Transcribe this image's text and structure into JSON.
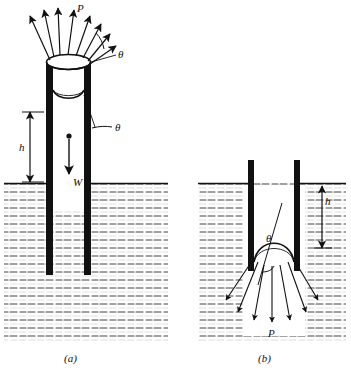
{
  "figure": {
    "panels": [
      {
        "id": "a",
        "caption": "(a)",
        "labels": [
          {
            "name": "force-P",
            "text": "P"
          },
          {
            "name": "angle-theta-outer",
            "text": "θ"
          },
          {
            "name": "angle-theta-inner",
            "text": "θ"
          },
          {
            "name": "height-h",
            "text": "h"
          },
          {
            "name": "weight-W",
            "text": "W"
          }
        ]
      },
      {
        "id": "b",
        "caption": "(b)",
        "labels": [
          {
            "name": "angle-theta",
            "text": "θ"
          },
          {
            "name": "height-h",
            "text": "h"
          },
          {
            "name": "force-P",
            "text": "P"
          }
        ]
      }
    ],
    "colors": {
      "ink": "#111111",
      "hatch": "#333333",
      "background": "#ffffff"
    }
  }
}
